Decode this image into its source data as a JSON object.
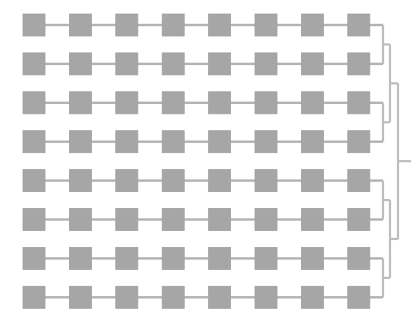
{
  "diagram": {
    "kind": "dendrogram",
    "title": "",
    "background_color": "#ffffff",
    "node": {
      "shape": "square",
      "fill_color": "#a6a6a6",
      "stroke_color": "#a0a0a0",
      "size": 22
    },
    "link": {
      "color": "#b3b3b3",
      "width": 2.4
    },
    "bracket": {
      "color": "#bdbdbd",
      "width": 2.2
    },
    "geometry": {
      "leaf_count": 8,
      "nodes_per_leaf": 8,
      "first_node_x": 23,
      "node_step_x": 46.4,
      "first_row_y": 14,
      "row_step_y": 38.9,
      "leaf_end_x": 383,
      "root_stub_x": 411
    },
    "merge_levels": {
      "level_1_x": 383,
      "level_2_x": 390,
      "level_3_x": 398
    },
    "leaves": [
      {
        "id": "leaf-1",
        "label": "",
        "nodes": [
          "n1-1",
          "n1-2",
          "n1-3",
          "n1-4",
          "n1-5",
          "n1-6",
          "n1-7",
          "n1-8"
        ]
      },
      {
        "id": "leaf-2",
        "label": "",
        "nodes": [
          "n2-1",
          "n2-2",
          "n2-3",
          "n2-4",
          "n2-5",
          "n2-6",
          "n2-7",
          "n2-8"
        ]
      },
      {
        "id": "leaf-3",
        "label": "",
        "nodes": [
          "n3-1",
          "n3-2",
          "n3-3",
          "n3-4",
          "n3-5",
          "n3-6",
          "n3-7",
          "n3-8"
        ]
      },
      {
        "id": "leaf-4",
        "label": "",
        "nodes": [
          "n4-1",
          "n4-2",
          "n4-3",
          "n4-4",
          "n4-5",
          "n4-6",
          "n4-7",
          "n4-8"
        ]
      },
      {
        "id": "leaf-5",
        "label": "",
        "nodes": [
          "n5-1",
          "n5-2",
          "n5-3",
          "n5-4",
          "n5-5",
          "n5-6",
          "n5-7",
          "n5-8"
        ]
      },
      {
        "id": "leaf-6",
        "label": "",
        "nodes": [
          "n6-1",
          "n6-2",
          "n6-3",
          "n6-4",
          "n6-5",
          "n6-6",
          "n6-7",
          "n6-8"
        ]
      },
      {
        "id": "leaf-7",
        "label": "",
        "nodes": [
          "n7-1",
          "n7-2",
          "n7-3",
          "n7-4",
          "n7-5",
          "n7-6",
          "n7-7",
          "n7-8"
        ]
      },
      {
        "id": "leaf-8",
        "label": "",
        "nodes": [
          "n8-1",
          "n8-2",
          "n8-3",
          "n8-4",
          "n8-5",
          "n8-6",
          "n8-7",
          "n8-8"
        ]
      }
    ],
    "merges": [
      {
        "id": "merge-1-2",
        "children": [
          "leaf-1",
          "leaf-2"
        ],
        "level": 1
      },
      {
        "id": "merge-3-4",
        "children": [
          "leaf-3",
          "leaf-4"
        ],
        "level": 1
      },
      {
        "id": "merge-5-6",
        "children": [
          "leaf-5",
          "leaf-6"
        ],
        "level": 1
      },
      {
        "id": "merge-7-8",
        "children": [
          "leaf-7",
          "leaf-8"
        ],
        "level": 1
      },
      {
        "id": "merge-top",
        "children": [
          "merge-1-2",
          "merge-3-4"
        ],
        "level": 2
      },
      {
        "id": "merge-bottom",
        "children": [
          "merge-5-6",
          "merge-7-8"
        ],
        "level": 2
      },
      {
        "id": "merge-root",
        "children": [
          "merge-top",
          "merge-bottom"
        ],
        "level": 3
      }
    ]
  }
}
